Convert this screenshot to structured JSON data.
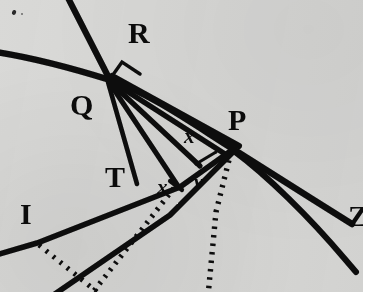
{
  "figure": {
    "background_color": "#d9d9d7",
    "ink_color": "#0b0b0b",
    "page_color": "#ffffff",
    "width": 370,
    "height": 300
  },
  "labels": {
    "R": "R",
    "Q": "Q",
    "P": "P",
    "T": "T",
    "I": "I",
    "Z": "Z",
    "x_upper": "x",
    "x_lower": "x",
    "v": "v"
  },
  "points": {
    "R_vertex": {
      "x": 110,
      "y": 79
    },
    "P_vertex": {
      "x": 233,
      "y": 148
    },
    "T_foot": {
      "x": 138,
      "y": 184
    },
    "I_node": {
      "x": 37,
      "y": 243
    },
    "fan_foot_a": {
      "x": 176,
      "y": 183
    },
    "fan_foot_b": {
      "x": 196,
      "y": 164
    }
  },
  "label_positions": {
    "R": {
      "x": 128,
      "y": 18
    },
    "Q": {
      "x": 70,
      "y": 90
    },
    "P": {
      "x": 228,
      "y": 105
    },
    "T": {
      "x": 105,
      "y": 162
    },
    "I": {
      "x": 20,
      "y": 199
    },
    "Z": {
      "x": 348,
      "y": 201
    },
    "x_upper": {
      "x": 184,
      "y": 126
    },
    "x_lower": {
      "x": 157,
      "y": 177
    },
    "v": {
      "x": 194,
      "y": 172
    }
  },
  "strokes": {
    "solid_count": 9,
    "dotted_count": 3,
    "right_angle_marks": 2
  }
}
